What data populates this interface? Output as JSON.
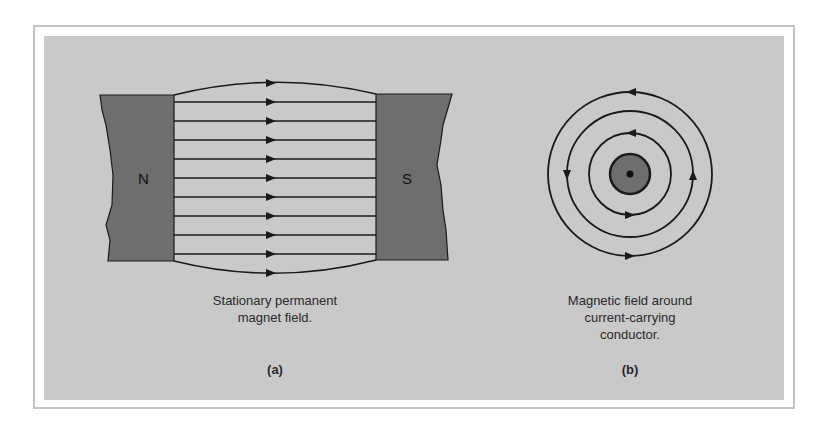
{
  "figure": {
    "panel_a": {
      "north_label": "N",
      "south_label": "S",
      "caption_line1": "Stationary permanent",
      "caption_line2": "magnet field.",
      "sublabel": "(a)",
      "field_lines": 11
    },
    "panel_b": {
      "caption_line1": "Magnetic field around",
      "caption_line2": "current-carrying",
      "caption_line3": "conductor.",
      "sublabel": "(b)",
      "rings": 3
    },
    "colors": {
      "background": "#c9c9c9",
      "magnet": "#6e6e6e",
      "line": "#1a1a1a",
      "border": "#c4c4c4"
    }
  }
}
